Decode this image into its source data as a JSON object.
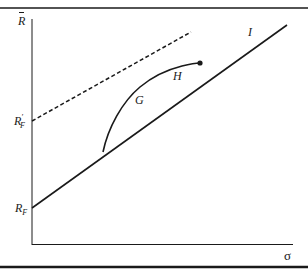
{
  "figure": {
    "y_axis_label": "R",
    "x_axis_label": "σ",
    "intercepts": {
      "rf_label": "R",
      "rf_sub": "F",
      "rf_prime_label": "R",
      "rf_prime_sup": "′",
      "rf_prime_sub": "F"
    },
    "points": {
      "g_label": "G",
      "h_label": "H",
      "i_label": "I"
    },
    "colors": {
      "line": "#1a1a1a",
      "background": "#ffffff"
    }
  }
}
